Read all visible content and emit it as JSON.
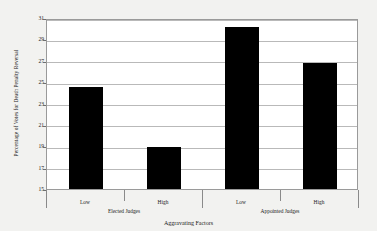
{
  "chart_data": {
    "type": "bar",
    "title": "",
    "xlabel": "Aggravating Factors",
    "ylabel": "Percentage of Votes for Death Penalty Reversal",
    "categories": [
      "Low",
      "High",
      "Low",
      "High"
    ],
    "values": [
      24.5,
      18.9,
      30.2,
      26.8
    ],
    "groups": [
      {
        "label": "Elected Judges",
        "categories": [
          "Low",
          "High"
        ],
        "values": [
          24.5,
          18.9
        ]
      },
      {
        "label": "Appointed Judges",
        "categories": [
          "Low",
          "High"
        ],
        "values": [
          30.2,
          26.8
        ]
      }
    ],
    "ylim": [
      15,
      31
    ],
    "ytick_step": 2,
    "yticks": [
      31,
      29,
      27,
      25,
      23,
      21,
      19,
      17,
      15
    ],
    "ytick_labels": [
      "31",
      "29",
      "27",
      "25",
      "23",
      "21",
      "19",
      "17",
      "15"
    ],
    "grid": true,
    "legend": "none",
    "bar_color": "#000000",
    "plot_background": "#ffffff",
    "page_background": "#f2f2f0",
    "gridline_color": "#b9b9b9",
    "frame_color": "#9a9a9a"
  },
  "axes": {
    "y_title": "Percentage of Votes for Death Penalty Reversal",
    "x_title": "Aggravating Factors"
  }
}
